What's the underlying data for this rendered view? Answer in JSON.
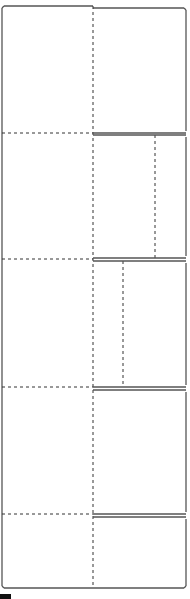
{
  "diagram": {
    "type": "dieline-folding-template",
    "width": 190,
    "height": 599,
    "colors": {
      "cut_line": "#555555",
      "fold_line": "#333333",
      "background": "#ffffff",
      "marker": "#111111"
    },
    "outline": {
      "left": 2,
      "top_left_panel": 6,
      "top_right_panel": 8,
      "right": 186,
      "bottom": 588,
      "center_x": 93
    },
    "sections": [
      {
        "name": "section-1",
        "top": 6,
        "bottom": 133,
        "right_inner_fold_x": null
      },
      {
        "name": "section-2",
        "top": 135,
        "bottom": 258,
        "right_inner_fold_x": 155
      },
      {
        "name": "section-3",
        "top": 261,
        "bottom": 387,
        "right_inner_fold_x": 123
      },
      {
        "name": "section-4",
        "top": 390,
        "bottom": 514,
        "right_inner_fold_x": null
      },
      {
        "name": "section-5",
        "top": 517,
        "bottom": 588,
        "right_inner_fold_x": null
      }
    ],
    "horizontal_folds_left": [
      133,
      259,
      387,
      514
    ],
    "right_cut_pairs": [
      [
        133,
        135
      ],
      [
        258,
        261
      ],
      [
        387,
        390
      ],
      [
        514,
        517
      ]
    ]
  }
}
